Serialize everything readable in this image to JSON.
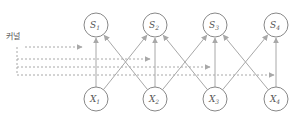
{
  "label": "커널",
  "colors": {
    "node_stroke": "#888888",
    "edge": "#a8a8a8",
    "text": "#555555"
  },
  "nodes": {
    "outputs": [
      {
        "id": "S1",
        "base": "S",
        "sub": "1"
      },
      {
        "id": "S2",
        "base": "S",
        "sub": "2"
      },
      {
        "id": "S3",
        "base": "S",
        "sub": "3"
      },
      {
        "id": "S4",
        "base": "S",
        "sub": "4"
      }
    ],
    "inputs": [
      {
        "id": "X1",
        "base": "X",
        "sub": "1"
      },
      {
        "id": "X2",
        "base": "X",
        "sub": "2"
      },
      {
        "id": "X3",
        "base": "X",
        "sub": "3"
      },
      {
        "id": "X4",
        "base": "X",
        "sub": "4"
      }
    ]
  },
  "edges": [
    [
      "X1",
      "S1"
    ],
    [
      "X1",
      "S2"
    ],
    [
      "X2",
      "S1"
    ],
    [
      "X2",
      "S2"
    ],
    [
      "X2",
      "S3"
    ],
    [
      "X3",
      "S2"
    ],
    [
      "X3",
      "S3"
    ],
    [
      "X3",
      "S4"
    ],
    [
      "X4",
      "S3"
    ],
    [
      "X4",
      "S4"
    ]
  ],
  "kernel_arrows_to": [
    "S1",
    "S2",
    "S3",
    "S4"
  ]
}
